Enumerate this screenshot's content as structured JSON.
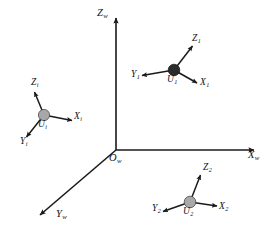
{
  "figure": {
    "type": "coordinate-frame-diagram",
    "background_color": "#ffffff",
    "ink_color": "#1a1a1a",
    "width": 270,
    "height": 246
  },
  "world_frame": {
    "name": "world-coordinate-frame",
    "origin": {
      "label": "O",
      "subscript": "w",
      "x": 116,
      "y": 150
    },
    "axes": [
      {
        "name": "axis-zw",
        "label": "Z",
        "subscript": "w",
        "direction": "up",
        "from": [
          116,
          150
        ],
        "to": [
          116,
          16
        ],
        "label_x": 98,
        "label_y": 10
      },
      {
        "name": "axis-xw",
        "label": "X",
        "subscript": "w",
        "direction": "right",
        "from": [
          116,
          150
        ],
        "to": [
          256,
          150
        ],
        "label_x": 249,
        "label_y": 154
      },
      {
        "name": "axis-yw",
        "label": "Y",
        "subscript": "w",
        "direction": "down-left",
        "from": [
          116,
          150
        ],
        "to": [
          38,
          217
        ],
        "label_x": 57,
        "label_y": 214
      }
    ]
  },
  "local_frames": [
    {
      "name": "frame-ui",
      "node_label": "U",
      "node_subscript": "i",
      "node_x": 44,
      "node_y": 115,
      "node_radius": 5.6,
      "node_color": "#a8a8a8",
      "node_style": "gray",
      "node_label_x": 39,
      "node_label_y": 122,
      "axes": [
        {
          "name": "axis-zi",
          "label": "Z",
          "subscript": "i",
          "to": [
            33,
            89
          ],
          "label_x": 32,
          "label_y": 81
        },
        {
          "name": "axis-xi",
          "label": "X",
          "subscript": "i",
          "to": [
            75,
            121
          ],
          "label_x": 76,
          "label_y": 117
        },
        {
          "name": "axis-yi",
          "label": "Y",
          "subscript": "i",
          "to": [
            24,
            140
          ],
          "label_x": 22,
          "label_y": 141
        }
      ]
    },
    {
      "name": "frame-u1",
      "node_label": "U",
      "node_subscript": "1",
      "node_x": 174,
      "node_y": 70,
      "node_radius": 5.8,
      "node_color": "#2b2b2b",
      "node_style": "dark",
      "node_label_x": 168,
      "node_label_y": 77,
      "axes": [
        {
          "name": "axis-z1",
          "label": "Z",
          "subscript": "1",
          "to": [
            195,
            43
          ],
          "label_x": 192,
          "label_y": 38
        },
        {
          "name": "axis-x1",
          "label": "X",
          "subscript": "1",
          "to": [
            200,
            85
          ],
          "label_x": 200,
          "label_y": 79
        },
        {
          "name": "axis-y1",
          "label": "Y",
          "subscript": "1",
          "to": [
            139,
            76
          ],
          "label_x": 135,
          "label_y": 72
        }
      ]
    },
    {
      "name": "frame-u2",
      "node_label": "U",
      "node_subscript": "2",
      "node_x": 190,
      "node_y": 202,
      "node_radius": 5.8,
      "node_color": "#a8a8a8",
      "node_style": "gray",
      "node_label_x": 184,
      "node_label_y": 209,
      "axes": [
        {
          "name": "axis-z2",
          "label": "Z",
          "subscript": "2",
          "to": [
            202,
            172
          ],
          "label_x": 204,
          "label_y": 166
        },
        {
          "name": "axis-x2",
          "label": "X",
          "subscript": "2",
          "to": [
            220,
            207
          ],
          "label_x": 219,
          "label_y": 205
        },
        {
          "name": "axis-y2",
          "label": "Y",
          "subscript": "2",
          "to": [
            160,
            213
          ],
          "label_x": 155,
          "label_y": 207
        }
      ]
    }
  ]
}
